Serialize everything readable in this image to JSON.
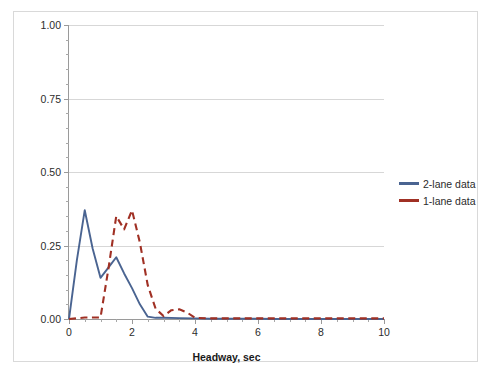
{
  "chart_data": {
    "type": "line",
    "title": "",
    "xlabel": "Headway, sec",
    "ylabel": "Proportion of total",
    "xlim": [
      0,
      10
    ],
    "ylim": [
      0,
      1.0
    ],
    "grid": "horizontal-major",
    "legend_position": "right",
    "x_ticks": [
      "0",
      "2",
      "4",
      "6",
      "8",
      "10"
    ],
    "x_tick_values": [
      0,
      2,
      4,
      6,
      8,
      10
    ],
    "x_minor_step": 0.5,
    "y_ticks": [
      "0.00",
      "0.25",
      "0.50",
      "0.75",
      "1.00"
    ],
    "y_tick_values": [
      0,
      0.25,
      0.5,
      0.75,
      1.0
    ],
    "y_minor_step": 0.05,
    "series": [
      {
        "name": "2-lane data",
        "color": "#4a6491",
        "style": "solid",
        "x": [
          0,
          0.25,
          0.5,
          0.75,
          1.0,
          1.25,
          1.5,
          1.75,
          2.0,
          2.25,
          2.5,
          2.75,
          3.0,
          3.5,
          4.0,
          4.5,
          5.0,
          5.5,
          6.0,
          6.5,
          7.0,
          7.5,
          8.0,
          8.5,
          9.0,
          9.5,
          10.0
        ],
        "values": [
          0.0,
          0.2,
          0.37,
          0.24,
          0.14,
          0.175,
          0.21,
          0.155,
          0.105,
          0.05,
          0.008,
          0.004,
          0.004,
          0.003,
          0.002,
          0.001,
          0.001,
          0.001,
          0.001,
          0.0,
          0.0,
          0.0,
          0.0,
          0.0,
          0.0,
          0.0,
          0.0
        ]
      },
      {
        "name": "1-lane data",
        "color": "#a03024",
        "style": "dashed",
        "x": [
          0,
          0.5,
          1.0,
          1.25,
          1.5,
          1.75,
          2.0,
          2.25,
          2.5,
          2.75,
          3.0,
          3.25,
          3.5,
          3.75,
          4.0,
          4.5,
          5.0,
          5.5,
          6.0,
          6.5,
          7.0,
          7.5,
          8.0,
          8.5,
          9.0,
          9.5,
          10.0
        ],
        "values": [
          0.0,
          0.005,
          0.005,
          0.17,
          0.35,
          0.305,
          0.37,
          0.26,
          0.115,
          0.035,
          0.01,
          0.03,
          0.033,
          0.022,
          0.004,
          0.002,
          0.002,
          0.002,
          0.002,
          0.002,
          0.002,
          0.002,
          0.002,
          0.002,
          0.002,
          0.002,
          0.002
        ]
      }
    ]
  },
  "legend": {
    "items": [
      {
        "label": "2-lane data",
        "color": "#4a6491"
      },
      {
        "label": "1-lane data",
        "color": "#a03024"
      }
    ]
  },
  "axes": {
    "x_title": "Headway, sec",
    "y_title": "Proportion of total"
  }
}
